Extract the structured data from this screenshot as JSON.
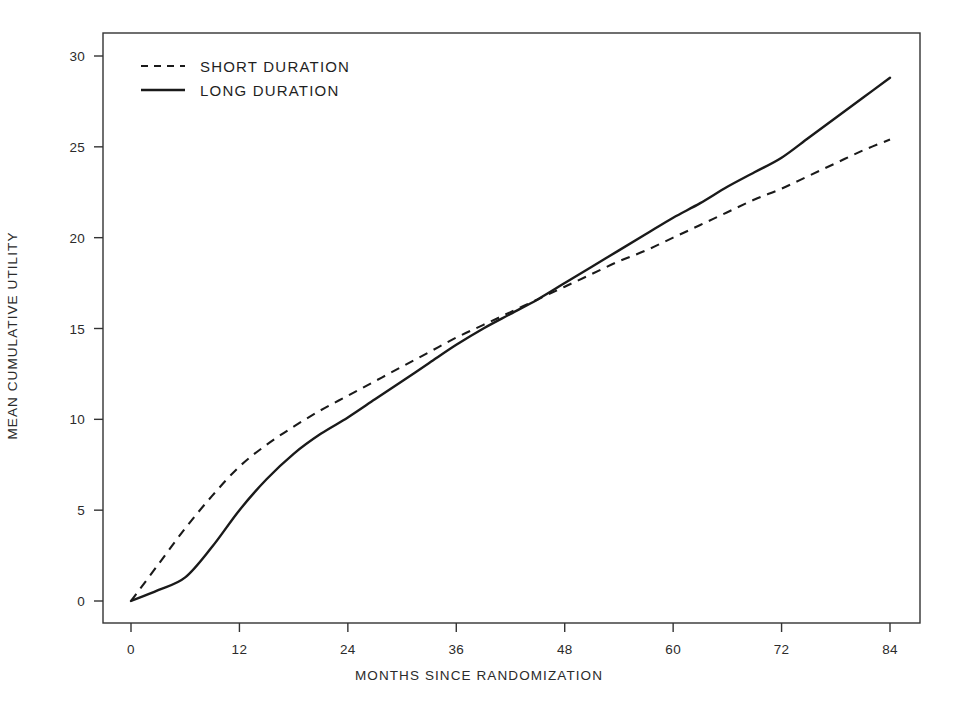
{
  "chart_data": {
    "type": "line",
    "title": "",
    "subtitle": "",
    "xlabel": "MONTHS SINCE RANDOMIZATION",
    "ylabel": "MEAN CUMULATIVE UTILITY",
    "xlim": [
      0,
      84
    ],
    "ylim": [
      0,
      30
    ],
    "xticks": [
      0,
      12,
      24,
      36,
      48,
      60,
      72,
      84
    ],
    "yticks": [
      0,
      5,
      10,
      15,
      20,
      25,
      30
    ],
    "xtick_labels": [
      "0",
      "12",
      "24",
      "36",
      "48",
      "60",
      "72",
      "84"
    ],
    "ytick_labels": [
      "0",
      "5",
      "10",
      "15",
      "20",
      "25",
      "30"
    ],
    "grid": false,
    "legend_position": "upper-left-inside",
    "x": [
      0,
      3,
      6,
      9,
      12,
      15,
      18,
      21,
      24,
      27,
      30,
      33,
      36,
      39,
      42,
      45,
      48,
      51,
      54,
      57,
      60,
      63,
      66,
      69,
      72,
      75,
      78,
      81,
      84
    ],
    "series": [
      {
        "name": "SHORT DURATION",
        "style": "dashed",
        "color": "#1a1a1a",
        "values": [
          0.0,
          2.0,
          4.0,
          5.8,
          7.4,
          8.6,
          9.6,
          10.5,
          11.3,
          12.1,
          12.9,
          13.7,
          14.5,
          15.2,
          15.9,
          16.6,
          17.3,
          18.0,
          18.7,
          19.3,
          20.0,
          20.7,
          21.4,
          22.1,
          22.7,
          23.4,
          24.1,
          24.8,
          25.4
        ]
      },
      {
        "name": "LONG DURATION",
        "style": "solid",
        "color": "#1a1a1a",
        "values": [
          0.0,
          0.6,
          1.3,
          3.0,
          5.0,
          6.7,
          8.1,
          9.2,
          10.1,
          11.1,
          12.1,
          13.1,
          14.1,
          15.0,
          15.8,
          16.6,
          17.5,
          18.4,
          19.3,
          20.2,
          21.1,
          21.9,
          22.8,
          23.6,
          24.4,
          25.5,
          26.6,
          27.7,
          28.8
        ]
      }
    ],
    "annotations": [],
    "crossover": {
      "x": 43.5,
      "y": 16.3
    }
  },
  "legend": {
    "items": [
      {
        "label": "SHORT DURATION",
        "style": "dashed"
      },
      {
        "label": "LONG DURATION",
        "style": "solid"
      }
    ]
  },
  "axes": {
    "x_title": "MONTHS SINCE RANDOMIZATION",
    "y_title": "MEAN CUMULATIVE UTILITY"
  },
  "colors": {
    "line": "#1a1a1a",
    "frame": "#333333",
    "background": "#ffffff",
    "text": "#2b2b2b"
  }
}
